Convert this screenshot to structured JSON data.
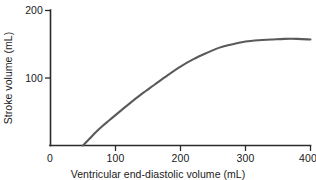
{
  "chart_data": {
    "type": "line",
    "title": "",
    "subtitle": "",
    "xlabel": "Ventricular end-diastolic volume (mL)",
    "ylabel": "Stroke volume (mL)",
    "xlim": [
      0,
      400
    ],
    "ylim": [
      0,
      200
    ],
    "xticks": [
      0,
      100,
      200,
      300,
      400
    ],
    "yticks": [
      0,
      100,
      200
    ],
    "xtick_labels": [
      "0",
      "100",
      "200",
      "300",
      "400"
    ],
    "ytick_labels": [
      "0",
      "100",
      "200"
    ],
    "grid": false,
    "legend": false,
    "legend_position": "none",
    "annotations": [],
    "series": [
      {
        "name": "Frank-Starling curve",
        "color": "#5a5a5a",
        "x": [
          50,
          60,
          70,
          80,
          90,
          100,
          120,
          140,
          160,
          180,
          200,
          220,
          240,
          260,
          280,
          300,
          320,
          340,
          360,
          380,
          400
        ],
        "y": [
          0,
          10,
          20,
          29,
          37,
          45,
          61,
          76,
          90,
          104,
          117,
          128,
          137,
          145,
          150,
          154,
          156,
          157,
          158,
          158,
          157
        ]
      }
    ]
  },
  "axes": {
    "x_title": "Ventricular end-diastolic volume (mL)",
    "y_title": "Stroke volume (mL)",
    "x_ticks": [
      "0",
      "100",
      "200",
      "300",
      "400"
    ],
    "y_ticks": [
      "200",
      "100",
      "0"
    ],
    "axis_color": "#2b2b2b"
  },
  "colors": {
    "background": "#ffffff",
    "curve": "#5a5a5a",
    "axis": "#2b2b2b",
    "text": "#1a1a1a"
  }
}
